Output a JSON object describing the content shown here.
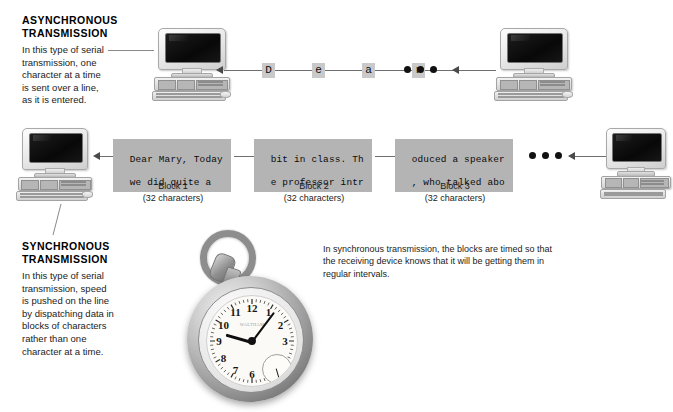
{
  "figure": {
    "title_async": "ASYNCHRONOUS TRANSMISSION",
    "title_sync": "SYNCHRONOUS TRANSMISSION"
  },
  "async_section": {
    "heading_line1": "ASYNCHRONOUS",
    "heading_line2": "TRANSMISSION",
    "body": "In this type of serial transmission, one character at a time is sent over a line, as it is entered.",
    "characters": [
      "D",
      "e",
      "a",
      "r"
    ],
    "ellipsis_dots": 3
  },
  "sync_section": {
    "heading_line1": "SYNCHRONOUS",
    "heading_line2": "TRANSMISSION",
    "body": "In this type of serial transmission, speed is pushed on the line by dispatching data in blocks of characters rather than one character at a time.",
    "ellipsis_dots": 3,
    "blocks": [
      {
        "line1": "Dear Mary, Today",
        "line2": "we did quite a",
        "label": "Block 1",
        "sublabel": "(32 characters)"
      },
      {
        "line1": "bit in class. Th",
        "line2": "e professor intr",
        "label": "Block 2",
        "sublabel": "(32 characters)"
      },
      {
        "line1": "oduced a speaker",
        "line2": ", who talked abo",
        "label": "Block 3",
        "sublabel": "(32 characters)"
      }
    ]
  },
  "watch_caption": {
    "text": "In synchronous transmission, the blocks are timed so that the receiving device knows that it will be getting them in regular intervals."
  },
  "pocket_watch": {
    "numerals": [
      "12",
      "1",
      "2",
      "3",
      "4",
      "5",
      "6",
      "7",
      "8",
      "9",
      "10",
      "11"
    ],
    "brand": "WALTHAM",
    "hour_hand_deg": 196,
    "minute_hand_deg": -53,
    "seconds_subdial_deg": 74
  },
  "colors": {
    "block_background": "#b4b4b4",
    "char_tile_background": "#c9c9c9",
    "line": "#6f6f6f",
    "arrow": "#4a4a4a",
    "text": "#1b1b1b",
    "page_background": "#ffffff"
  }
}
